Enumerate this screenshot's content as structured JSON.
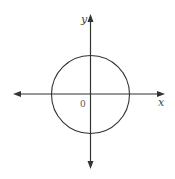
{
  "diagram": {
    "type": "unit-circle-on-axes",
    "labels": {
      "x_axis": "x",
      "y_axis": "y",
      "origin": "0"
    },
    "colors": {
      "stroke": "#333333",
      "background": "#ffffff"
    }
  }
}
